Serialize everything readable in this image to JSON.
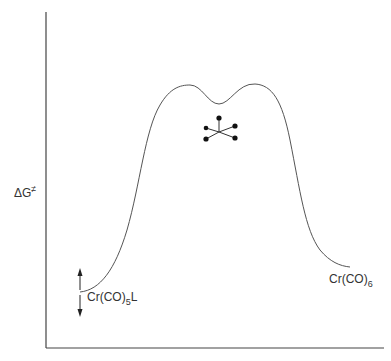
{
  "diagram": {
    "type": "energy-profile",
    "y_axis_label": "ΔG",
    "y_axis_label_superscript": "≠",
    "reactant": {
      "label": "Cr(CO)",
      "subscript": "5",
      "suffix": "L"
    },
    "product": {
      "label": "Cr(CO)",
      "subscript": "6"
    },
    "transition_state_icon": "seven-coordinate-intermediate-icon",
    "colors": {
      "line": "#555555",
      "axis": "#444444",
      "dot": "#111111"
    }
  }
}
